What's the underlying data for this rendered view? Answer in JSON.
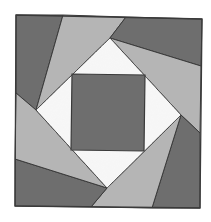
{
  "colors": {
    "dark": "#6e6e6e",
    "light": "#b5b5b5",
    "speckle": "#eeeeee",
    "outline": "#3a3a3a",
    "background": "#ffffff"
  },
  "pieces": [
    {
      "name": "top-left-dark-blade",
      "tone": "dark",
      "points": "16,15 63,15 36,110 16,93"
    },
    {
      "name": "top-light-blade",
      "tone": "light",
      "points": "63,15 126,17 110,38 36,110"
    },
    {
      "name": "top-right-dark-blade",
      "tone": "dark",
      "points": "126,17 202,19 201,66 110,38"
    },
    {
      "name": "right-light-blade",
      "tone": "light",
      "points": "110,38 201,66 200,133 181,115"
    },
    {
      "name": "bottom-right-dark-blade",
      "tone": "dark",
      "points": "181,115 200,133 200,208 152,208"
    },
    {
      "name": "bottom-light-blade",
      "tone": "light",
      "points": "181,115 152,208 91,207 107,188"
    },
    {
      "name": "bottom-left-dark-blade",
      "tone": "dark",
      "points": "107,188 91,207 15,206 15,159"
    },
    {
      "name": "left-light-blade",
      "tone": "light",
      "points": "36,110 16,93 15,159 107,188"
    }
  ],
  "diamond": {
    "points": "110,38 181,115 107,188 36,110"
  },
  "center_square": {
    "points": "72,74 145,75 144,151 71,150"
  },
  "outer_square": {
    "points": "16,15 202,19 200,208 15,206"
  }
}
